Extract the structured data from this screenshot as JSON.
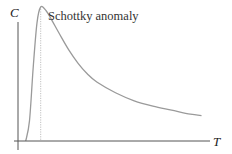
{
  "chart_data": {
    "type": "line",
    "title": "",
    "xlabel": "T",
    "ylabel": "C",
    "annotations": [
      {
        "text": "Schottky anomaly",
        "x": 1.0
      }
    ],
    "xlim": [
      0,
      10
    ],
    "ylim": [
      0,
      1.0
    ],
    "grid": false,
    "legend": "none",
    "series": [
      {
        "name": "heat capacity",
        "x": [
          0.2,
          0.4,
          0.6,
          0.8,
          1.0,
          1.3,
          1.6,
          2.0,
          2.5,
          3.0,
          3.5,
          4.0,
          5.0,
          6.0,
          7.0,
          8.0,
          9.0,
          9.6
        ],
        "values": [
          0.0,
          0.15,
          0.55,
          0.88,
          1.0,
          0.97,
          0.9,
          0.8,
          0.68,
          0.58,
          0.5,
          0.44,
          0.36,
          0.3,
          0.26,
          0.23,
          0.2,
          0.19
        ]
      }
    ],
    "peak_marker": {
      "x": 1.0,
      "style": "dotted-vertical"
    }
  },
  "colors": {
    "axis": "#555555",
    "curve": "#9a9a9a",
    "marker": "#b0b0b0"
  }
}
